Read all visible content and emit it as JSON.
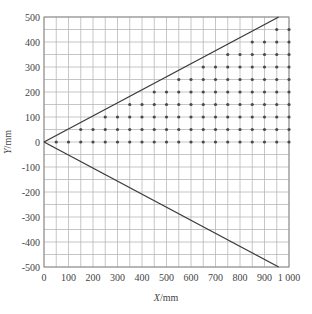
{
  "chart_data": {
    "type": "scatter",
    "title": "",
    "xlabel": "X/mm",
    "ylabel": "Y/mm",
    "xlabel_parts": {
      "var": "X",
      "unit": "/mm"
    },
    "ylabel_parts": {
      "var": "Y",
      "unit": "/mm"
    },
    "xlim": [
      0,
      1000
    ],
    "ylim": [
      -500,
      500
    ],
    "grid": true,
    "grid_step": 50,
    "x_ticks": [
      0,
      100,
      200,
      300,
      400,
      500,
      600,
      700,
      800,
      900,
      1000
    ],
    "x_tick_labels": [
      "0",
      "100",
      "200",
      "300",
      "400",
      "500",
      "600",
      "700",
      "800",
      "900",
      "1 000"
    ],
    "y_ticks": [
      500,
      400,
      300,
      200,
      100,
      0,
      -100,
      -200,
      -300,
      -400,
      -500
    ],
    "y_tick_labels": [
      "500",
      "400",
      "300",
      "200",
      "100",
      "0",
      "-100",
      "-200",
      "-300",
      "-400",
      "-500"
    ],
    "lines": [
      {
        "name": "upper-boundary",
        "points": [
          [
            0,
            0
          ],
          [
            958,
            500
          ]
        ]
      },
      {
        "name": "lower-boundary",
        "points": [
          [
            0,
            0
          ],
          [
            958,
            -500
          ]
        ]
      }
    ],
    "points_rule": "grid points with step 50 where y in [0, 450] and x >= 2*y + 50, x <= 1000",
    "rows": [
      {
        "y": 0,
        "x_start": 50,
        "x_end": 1000
      },
      {
        "y": 50,
        "x_start": 150,
        "x_end": 1000
      },
      {
        "y": 100,
        "x_start": 250,
        "x_end": 1000
      },
      {
        "y": 150,
        "x_start": 350,
        "x_end": 1000
      },
      {
        "y": 200,
        "x_start": 450,
        "x_end": 1000
      },
      {
        "y": 250,
        "x_start": 550,
        "x_end": 1000
      },
      {
        "y": 300,
        "x_start": 650,
        "x_end": 1000
      },
      {
        "y": 350,
        "x_start": 750,
        "x_end": 1000
      },
      {
        "y": 400,
        "x_start": 850,
        "x_end": 1000
      },
      {
        "y": 450,
        "x_start": 950,
        "x_end": 1000
      }
    ],
    "colors": {
      "grid": "#b8b8b8",
      "frame": "#8a8a8a",
      "line": "#3a3a3a",
      "point": "#4a4a4a",
      "text": "#444444"
    }
  }
}
